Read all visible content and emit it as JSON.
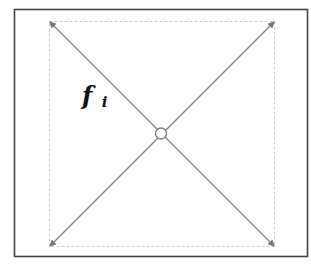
{
  "diagram": {
    "label": {
      "symbol": "f",
      "subscript": "i"
    },
    "colors": {
      "frame": "#444444",
      "inner_square": "#c8c8c8",
      "diagonal": "#888888",
      "node_stroke": "#777777",
      "node_fill": "#ffffff",
      "text": "#111111"
    },
    "elements": {
      "frame": "outer rectangle border",
      "inner_square": "dashed square",
      "diagonals": [
        "top-left to bottom-right",
        "bottom-left to top-right"
      ],
      "center_node": "open circle at intersection"
    }
  }
}
